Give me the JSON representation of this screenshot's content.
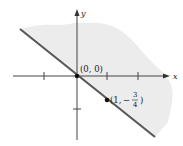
{
  "figure": {
    "axes": {
      "x_label": "x",
      "y_label": "y"
    },
    "points": [
      {
        "label": "(0, 0)",
        "x": 0,
        "y": 0
      },
      {
        "label_prefix": "(1, ",
        "label_minus": "−",
        "frac_num": "3",
        "frac_den": "4",
        "label_suffix": ")",
        "x": 1,
        "y": -0.75
      }
    ],
    "colors": {
      "shade": "#ececec",
      "line": "#555555",
      "axis": "#444444",
      "point": "#111111"
    }
  }
}
